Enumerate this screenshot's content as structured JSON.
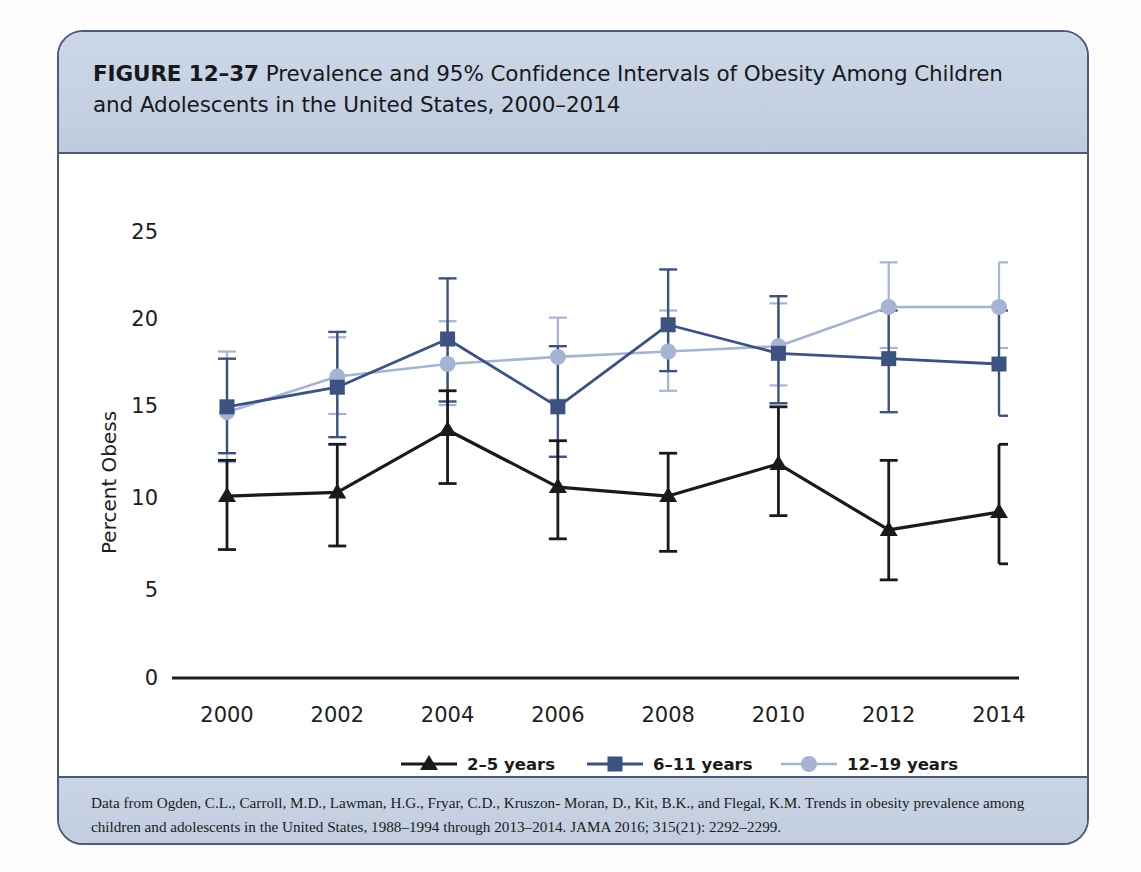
{
  "figure": {
    "number_label": "FIGURE 12–37",
    "title_line1": "Prevalence and 95% Confidence Intervals of Obesity Among Children",
    "title_line2": "and Adolescents in the United States, 2000–2014",
    "source_line1": "Data from Ogden, C.L., Carroll, M.D., Lawman, H.G., Fryar, C.D., Kruszon- Moran, D., Kit, B.K., and Flegal, K.M. Trends in obesity",
    "source_line2": "prevalence among children and adolescents in the United States, 1988–1994 through 2013–2014. JAMA 2016; 315(21): 2292–2299."
  },
  "colors": {
    "series_2_5": "#1a1a1a",
    "series_6_11": "#3c5280",
    "series_12_19": "#a6b4d4",
    "frame_border": "#4a5a78",
    "header_bg": "#c8d3e3",
    "axis": "#1d1d1f"
  },
  "chart_data": {
    "type": "line",
    "xlabel": "",
    "ylabel": "Percent Obess",
    "x": [
      2000,
      2002,
      2004,
      2006,
      2008,
      2010,
      2012,
      2014
    ],
    "xtick_labels": [
      "2000",
      "2002",
      "2004",
      "2006",
      "2008",
      "2010",
      "2012",
      "2014"
    ],
    "ytick_labels": [
      "0",
      "5",
      "10",
      "15",
      "20",
      "25"
    ],
    "yticks": [
      0,
      5,
      10,
      15,
      20,
      25
    ],
    "ylim": [
      0,
      26.5
    ],
    "grid": false,
    "legend_position": "bottom",
    "error_bars": "95% confidence intervals",
    "series": [
      {
        "name": "2–5 years",
        "marker": "triangle",
        "color": "#1a1a1a",
        "values": [
          10.2,
          10.4,
          13.9,
          10.7,
          10.2,
          12.0,
          8.3,
          9.3
        ],
        "ci_low": [
          7.2,
          7.4,
          10.9,
          7.8,
          7.1,
          9.1,
          5.5,
          6.4
        ],
        "ci_high": [
          12.2,
          13.1,
          16.1,
          13.3,
          12.6,
          15.2,
          12.2,
          13.1
        ]
      },
      {
        "name": "6–11 years",
        "marker": "square",
        "color": "#3c5280",
        "values": [
          15.2,
          16.3,
          19.0,
          15.2,
          19.8,
          18.2,
          17.9,
          17.6
        ],
        "ci_low": [
          12.6,
          13.5,
          15.5,
          12.4,
          17.2,
          15.4,
          14.9,
          14.7
        ],
        "ci_high": [
          17.9,
          19.4,
          22.4,
          18.6,
          22.9,
          21.4,
          20.6,
          20.6
        ]
      },
      {
        "name": "12–19 years",
        "marker": "circle",
        "color": "#a6b4d4",
        "values": [
          14.9,
          16.9,
          17.6,
          18.0,
          18.3,
          18.6,
          20.8,
          20.8
        ],
        "ci_low": [
          12.1,
          14.8,
          15.3,
          15.6,
          16.1,
          16.4,
          18.5,
          18.5
        ],
        "ci_high": [
          18.3,
          19.1,
          20.0,
          20.2,
          20.6,
          21.0,
          23.3,
          23.3
        ]
      }
    ]
  },
  "legend": [
    {
      "label": "2–5 years",
      "marker": "triangle",
      "color": "#1a1a1a"
    },
    {
      "label": "6–11 years",
      "marker": "square",
      "color": "#3c5280"
    },
    {
      "label": "12–19 years",
      "marker": "circle",
      "color": "#a6b4d4"
    }
  ]
}
